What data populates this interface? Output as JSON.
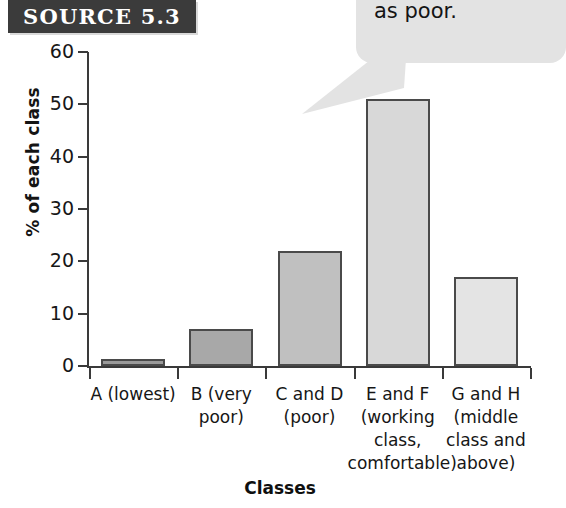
{
  "source_badge": {
    "label": "SOURCE 5.3"
  },
  "callout": {
    "line1": "were clas",
    "line2": "as poor.",
    "background": "#e3e3e3"
  },
  "chart_data": {
    "type": "bar",
    "title": "",
    "xlabel": "Classes",
    "ylabel": "% of each class",
    "ylim": [
      0,
      60
    ],
    "yticks": [
      0,
      10,
      20,
      30,
      40,
      50,
      60
    ],
    "ytick_labels": [
      "0",
      "10",
      "20",
      "30",
      "40",
      "50",
      "60"
    ],
    "grid": false,
    "legend": "none",
    "categories": [
      "A (lowest)",
      "B (very\npoor)",
      "C and D\n(poor)",
      "E and F\n(working\nclass,\ncomfortable)",
      "G and H\n(middle\nclass and\nabove)"
    ],
    "values": [
      1,
      7,
      22,
      51,
      17
    ],
    "bar_colors": [
      "#9a9a9a",
      "#a8a8a8",
      "#c0c0c0",
      "#d8d8d8",
      "#e4e4e4"
    ],
    "bar_edge_color": "#4a4a4a"
  }
}
